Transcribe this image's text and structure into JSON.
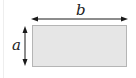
{
  "diagram": {
    "type": "rectangle-dimensions",
    "labels": {
      "width": "b",
      "height": "a"
    },
    "colors": {
      "rect_fill": "#e6e6e6",
      "rect_stroke": "#b5b5b5",
      "arrow": "#1a1a1a"
    }
  }
}
